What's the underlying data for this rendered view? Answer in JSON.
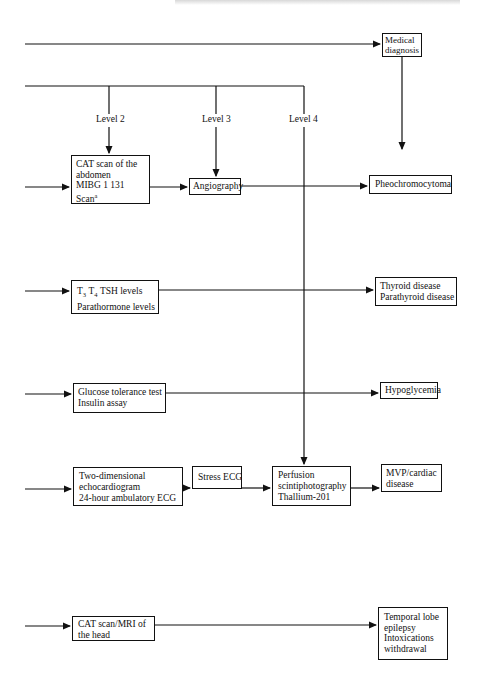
{
  "diagram": {
    "header_fragment": "",
    "top_path": {
      "target": "Medical diagnosis"
    },
    "levels": [
      {
        "label": "Level 2"
      },
      {
        "label": "Level 3"
      },
      {
        "label": "Level 4"
      }
    ],
    "nodes": {
      "medical_diagnosis": [
        "Medical",
        "diagnosis"
      ],
      "cat_abdomen": [
        "CAT scan of the",
        "abdomen",
        "MIBG 1 131",
        "Scan"
      ],
      "cat_abdomen_footnote": "a",
      "angiography": [
        "Angiography"
      ],
      "pheochromocytoma": [
        "Pheochromocytoma"
      ],
      "thyroid_tests": {
        "t3": "T",
        "t3_sub": "3",
        "t4": "T",
        "t4_sub": "4",
        "tsh": "TSH levels",
        "line2": "Parathormone levels"
      },
      "thyroid_outcome": [
        "Thyroid disease",
        "Parathyroid disease"
      ],
      "glucose_tests": [
        "Glucose tolerance test",
        "Insulin assay"
      ],
      "hypoglycemia": [
        "Hypoglycemia"
      ],
      "echo_tests": [
        "Two-dimensional",
        "echocardiogram",
        "24-hour ambulatory ECG"
      ],
      "stress_ecg": [
        "Stress ECG"
      ],
      "perfusion": [
        "Perfusion",
        "scintiphotography",
        "Thallium-201"
      ],
      "mvp_outcome": [
        "MVP/cardiac",
        "disease"
      ],
      "head_scan": [
        "CAT scan/MRI of",
        "the head"
      ],
      "head_outcome": [
        "Temporal lobe",
        "epilepsy",
        "Intoxications",
        "withdrawal"
      ]
    },
    "edges": [
      [
        "input",
        "Medical diagnosis"
      ],
      [
        "Medical diagnosis",
        "Pheochromocytoma"
      ],
      [
        "Level 2",
        "CAT scan of the abdomen"
      ],
      [
        "Level 3",
        "Angiography"
      ],
      [
        "Level 4",
        "Perfusion scintiphotography"
      ],
      [
        "input",
        "CAT scan of the abdomen"
      ],
      [
        "CAT scan of the abdomen",
        "Angiography"
      ],
      [
        "Angiography",
        "Pheochromocytoma"
      ],
      [
        "input",
        "T3 T4 TSH levels"
      ],
      [
        "T3 T4 TSH levels",
        "Thyroid disease / Parathyroid disease"
      ],
      [
        "input",
        "Glucose tolerance test"
      ],
      [
        "Glucose tolerance test",
        "Hypoglycemia"
      ],
      [
        "input",
        "Two-dimensional echocardiogram"
      ],
      [
        "Two-dimensional echocardiogram",
        "Stress ECG"
      ],
      [
        "Stress ECG",
        "Perfusion scintiphotography"
      ],
      [
        "Perfusion scintiphotography",
        "MVP/cardiac disease"
      ],
      [
        "input",
        "CAT scan/MRI of the head"
      ],
      [
        "CAT scan/MRI of the head",
        "Temporal lobe epilepsy"
      ]
    ],
    "colors": {
      "ink": "#111111",
      "background": "#ffffff"
    }
  }
}
